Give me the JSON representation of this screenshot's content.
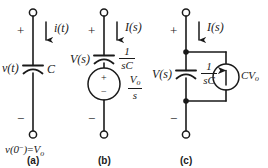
{
  "figure": {
    "ink_color": "#1a1a1a",
    "background": "#ffffff"
  },
  "panels": [
    {
      "id": "a",
      "caption": "(a)",
      "plus_sign": "+",
      "minus_sign": "−",
      "current_label": "i(t)",
      "voltage_label": "v(t)",
      "element_label": "C",
      "initial_condition": {
        "var": "v(0",
        "sup": "−",
        "tail": ")",
        "equals": "=",
        "value": "V",
        "value_sub": "o"
      },
      "element_type": "capacitor"
    },
    {
      "id": "b",
      "caption": "(b)",
      "plus_sign": "+",
      "minus_sign": "−",
      "current_label": "I(s)",
      "voltage_label": "V(s)",
      "impedance": {
        "numerator": "1",
        "denominator": "sC"
      },
      "source": {
        "type": "voltage-source",
        "plus_sign": "+",
        "minus_sign": "−",
        "label_numerator": "V",
        "label_numerator_sub": "o",
        "label_denominator": "s"
      },
      "element_type": "capacitor-with-voltage-source"
    },
    {
      "id": "c",
      "caption": "(c)",
      "plus_sign": "+",
      "minus_sign": "−",
      "current_label": "I(s)",
      "voltage_label": "V(s)",
      "impedance": {
        "numerator": "1",
        "denominator": "sC"
      },
      "source": {
        "type": "current-source",
        "label": "CV",
        "label_sub": "o",
        "arrow_direction": "up"
      },
      "element_type": "capacitor-with-current-source"
    }
  ]
}
